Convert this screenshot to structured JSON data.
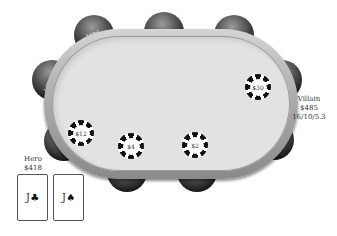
{
  "table": {
    "seats": [
      {
        "position": "UTG+1",
        "label": "UTG+1"
      },
      {
        "position": "MP1",
        "label": "MP1"
      },
      {
        "position": "MP2",
        "label": "MP2"
      },
      {
        "position": "HJ",
        "label": "HJ"
      },
      {
        "position": "CO",
        "label": "CO"
      },
      {
        "position": "BTN",
        "label": "B"
      },
      {
        "position": "SB",
        "label": "SB"
      },
      {
        "position": "BB",
        "label": "BB"
      },
      {
        "position": "UTG",
        "label": "UTG"
      }
    ],
    "bets": [
      {
        "seat": "CO",
        "amount": "$30"
      },
      {
        "seat": "UTG",
        "amount": "$12"
      },
      {
        "seat": "BB",
        "amount": "$4"
      },
      {
        "seat": "SB",
        "amount": "$2"
      }
    ]
  },
  "villain": {
    "name": "Villain",
    "stack": "$485",
    "stats": "16/10/5.3"
  },
  "hero": {
    "name": "Hero",
    "stack": "$418",
    "cards": [
      {
        "rank": "J",
        "suit": "♣"
      },
      {
        "rank": "J",
        "suit": "♠"
      }
    ]
  },
  "colors": {
    "felt": "#e2e2e2",
    "rail": "#a9a9a9",
    "seat": "#1c1c1c",
    "background": "#ffffff"
  }
}
